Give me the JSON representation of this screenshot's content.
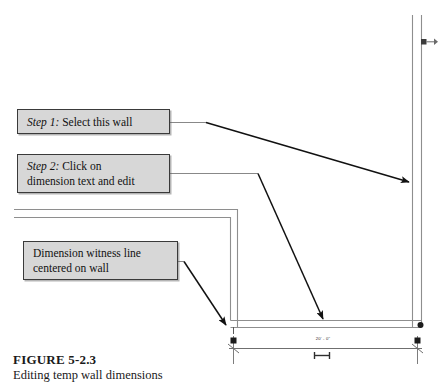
{
  "figure": {
    "title_prefix": "F",
    "title_rest": "IGURE",
    "title_number": "5-2.3",
    "title_full": "FIGURE 5-2.3",
    "subtitle": "Editing temp wall dimensions"
  },
  "callouts": [
    {
      "id": "step1",
      "label": "Step 1:",
      "text": " Select this wall"
    },
    {
      "id": "step2",
      "label": "Step 2:",
      "text": " Click on",
      "line2": "dimension text and edit"
    },
    {
      "id": "witness",
      "line1": "Dimension witness line",
      "line2": "centered on wall"
    }
  ],
  "drawing": {
    "dimension_value": "20' - 0\"",
    "colors": {
      "wall_line": "#8c8c8c",
      "wall_line_dark": "#5e5e5e",
      "leader": "#1a1a1a",
      "grip": "#1c1c1c",
      "dimension_line": "#6f6f6f",
      "callout_fill": "#d7d7d7",
      "callout_border": "#3a3a3a",
      "background": "#ffffff"
    }
  }
}
